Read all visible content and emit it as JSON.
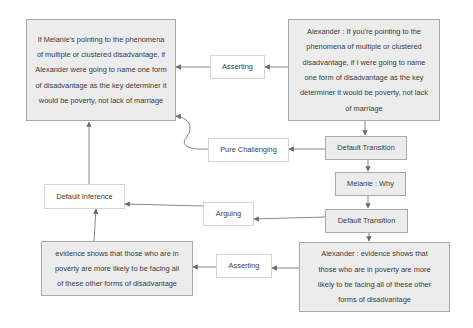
{
  "diagram": {
    "nodes": {
      "melanie_paraphrase": "If Melanie's pointing to the phenomena of multiple or clustered disadvantage, if Alexander were going to name one form of disadvantage as the key determiner it would be poverty, not lack of marriage",
      "alexander_claim": "Alexander : If you're pointing to the phenomena of multiple or clustered disadvantage, if I were going to name one form of disadvantage as the key determiner it would be poverty, not lack of marriage",
      "asserting_top": "Asserting",
      "pure_challenging": "Pure Challenging",
      "default_transition_1": "Default Transition",
      "melanie_why": "Melanie : Why",
      "default_transition_2": "Default Transition",
      "arguing": "Arguing",
      "default_inference": "Default Inference",
      "evidence_premise": "evidence shows that those who are in poverty are more likely to be facing all of these other forms of disadvantage",
      "asserting_bottom": "Asserting",
      "alexander_evidence": "Alexander : evidence shows that those who are in poverty are more likely to be facing all of these other forms of disadvantage"
    },
    "colors": {
      "locution_fill": "#ececec",
      "relation_fill": "#ffffff",
      "edge": "#6a6a6a"
    }
  }
}
